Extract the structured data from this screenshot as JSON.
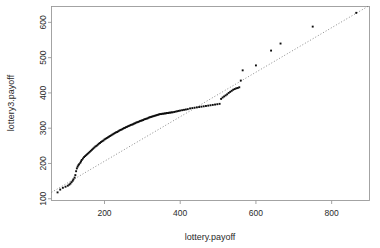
{
  "chart_data": {
    "type": "scatter",
    "title": "",
    "xlabel": "lottery.payoff",
    "ylabel": "lottery3.payoff",
    "xlim": [
      60,
      900
    ],
    "ylim": [
      95,
      645
    ],
    "xticks": [
      200,
      400,
      600,
      800
    ],
    "yticks": [
      100,
      200,
      300,
      400,
      500,
      600
    ],
    "grid": false,
    "legend": false,
    "reference_line": {
      "style": "dotted",
      "x": [
        60,
        900
      ],
      "y": [
        118,
        648
      ]
    },
    "point_style": {
      "marker": "filled-square",
      "size_px": 1.9,
      "color": "#0d0d0d"
    },
    "x": [
      76,
      83,
      90,
      97,
      103,
      107,
      110,
      113,
      116,
      118,
      121,
      123,
      125,
      127,
      129,
      131,
      133,
      136,
      138,
      140,
      143,
      146,
      149,
      152,
      155,
      158,
      161,
      164,
      167,
      170,
      173,
      176,
      179,
      182,
      185,
      188,
      191,
      194,
      197,
      200,
      203,
      206,
      209,
      212,
      215,
      218,
      221,
      224,
      227,
      230,
      233,
      236,
      239,
      242,
      245,
      248,
      251,
      254,
      257,
      260,
      263,
      266,
      269,
      272,
      275,
      278,
      281,
      284,
      287,
      290,
      293,
      296,
      299,
      302,
      305,
      308,
      311,
      314,
      317,
      320,
      323,
      326,
      329,
      332,
      335,
      338,
      341,
      344,
      347,
      350,
      353,
      356,
      359,
      362,
      365,
      368,
      371,
      374,
      377,
      380,
      384,
      388,
      392,
      396,
      400,
      405,
      410,
      415,
      420,
      426,
      432,
      438,
      444,
      450,
      456,
      462,
      468,
      474,
      480,
      486,
      492,
      498,
      504,
      508,
      512,
      516,
      520,
      524,
      528,
      532,
      536,
      540,
      544,
      548,
      552,
      556,
      560,
      565,
      600,
      640,
      665,
      750,
      865
    ],
    "y": [
      118,
      126,
      131,
      134,
      137,
      140,
      143,
      147,
      151,
      155,
      160,
      167,
      178,
      186,
      191,
      195,
      198,
      202,
      206,
      210,
      214,
      218,
      221,
      224,
      227,
      230,
      233,
      236,
      239,
      242,
      245,
      248,
      250,
      253,
      256,
      258,
      261,
      263,
      265,
      268,
      270,
      272,
      274,
      276,
      278,
      280,
      282,
      284,
      286,
      288,
      289,
      291,
      293,
      295,
      296,
      298,
      300,
      301,
      303,
      304,
      306,
      307,
      309,
      310,
      311,
      313,
      314,
      316,
      317,
      318,
      320,
      321,
      322,
      323,
      325,
      326,
      327,
      328,
      330,
      331,
      332,
      333,
      334,
      335,
      336,
      337,
      338,
      339,
      340,
      340,
      341,
      341,
      342,
      342,
      343,
      343,
      344,
      344,
      345,
      345,
      346,
      347,
      348,
      349,
      350,
      351,
      352,
      353,
      354,
      356,
      357,
      358,
      359,
      360,
      361,
      362,
      363,
      364,
      365,
      366,
      367,
      368,
      369,
      383,
      387,
      390,
      393,
      396,
      400,
      403,
      406,
      409,
      411,
      413,
      414,
      416,
      435,
      464,
      478,
      520,
      540,
      588,
      627
    ]
  },
  "axis": {
    "x_title": "lottery.payoff",
    "y_title": "lottery3.payoff",
    "x_tick_labels": [
      "200",
      "400",
      "600",
      "800"
    ],
    "y_tick_labels": [
      "100",
      "200",
      "300",
      "400",
      "500",
      "600"
    ]
  },
  "colors": {
    "point": "#0d0d0d",
    "frame": "#9a9a9a",
    "reference_line": "#6d6d6d",
    "background": "#ffffff",
    "text": "#2b2b2b"
  }
}
